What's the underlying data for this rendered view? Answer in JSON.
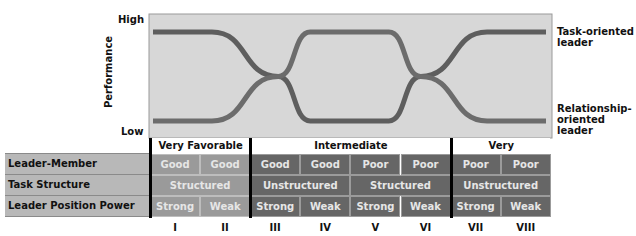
{
  "chart_data": {
    "type": "line",
    "title": "",
    "xlabel": "",
    "ylabel": "Performance",
    "y_ticks": [
      "Low",
      "High"
    ],
    "ylim": [
      0,
      1
    ],
    "categories": [
      "I",
      "II",
      "III",
      "IV",
      "V",
      "VI",
      "VII",
      "VIII"
    ],
    "grid": false,
    "series": [
      {
        "name": "Task-oriented leader",
        "color": "#5e5e5e",
        "points": [
          [
            0.0,
            1.0
          ],
          [
            1.2,
            1.0
          ],
          [
            2.55,
            0.5
          ],
          [
            3.2,
            0.0
          ],
          [
            4.8,
            0.0
          ],
          [
            5.45,
            0.5
          ],
          [
            6.8,
            1.0
          ],
          [
            8.0,
            1.0
          ]
        ]
      },
      {
        "name": "Relationship-oriented leader",
        "color": "#6c6c6c",
        "points": [
          [
            0.0,
            0.0
          ],
          [
            1.2,
            0.0
          ],
          [
            2.55,
            0.5
          ],
          [
            3.2,
            1.0
          ],
          [
            4.8,
            1.0
          ],
          [
            5.45,
            0.5
          ],
          [
            6.8,
            0.0
          ],
          [
            8.0,
            0.0
          ]
        ]
      }
    ],
    "legend": "right",
    "situation_bands": [
      {
        "label": "Very Favorable",
        "from": "I",
        "to": "II"
      },
      {
        "label": "Intermediate",
        "from": "III",
        "to": "VI"
      },
      {
        "label": "Very Unfavorable",
        "from": "VII",
        "to": "VIII"
      }
    ],
    "table": {
      "rows": [
        {
          "label": "Leader-Member Relations",
          "cells": [
            "Good",
            "Good",
            "Good",
            "Good",
            "Poor",
            "Poor",
            "Poor",
            "Poor"
          ]
        },
        {
          "label": "Task Structure",
          "cells": [
            {
              "text": "Structured",
              "span": 2
            },
            {
              "text": "Unstructured",
              "span": 2
            },
            {
              "text": "Structured",
              "span": 2
            },
            {
              "text": "Unstructured",
              "span": 2
            }
          ]
        },
        {
          "label": "Leader Position Power",
          "cells": [
            "Strong",
            "Weak",
            "Strong",
            "Weak",
            "Strong",
            "Weak",
            "Strong",
            "Weak"
          ]
        }
      ]
    }
  },
  "labels": {
    "high": "High",
    "low": "Low",
    "performance": "Performance",
    "legend_task": "Task-oriented leader",
    "legend_rel": "Relationship-oriented leader",
    "legend_task_lines": [
      "Task-oriented",
      "leader"
    ],
    "legend_rel_lines": [
      "Relationship-",
      "oriented",
      "leader"
    ]
  },
  "colors": {
    "plot_bg": "#d7d7d7",
    "favorable_cell": "#9a9a9a",
    "unfavorable_cell": "#666666",
    "row_label_bg": "#b8b8b8"
  }
}
